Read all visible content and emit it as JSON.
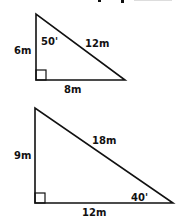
{
  "header": {
    "partial_text": "· ·"
  },
  "triangles": [
    {
      "left_side": "6m",
      "top_angle": "50'",
      "hypotenuse": "12m",
      "base": "8m",
      "right_angle": "bottom-left"
    },
    {
      "left_side": "9m",
      "hypotenuse": "18m",
      "bottom_right_angle": "40'",
      "base": "12m",
      "right_angle": "bottom-left"
    }
  ],
  "colors": {
    "stroke": "#111111",
    "background": "#ffffff"
  }
}
